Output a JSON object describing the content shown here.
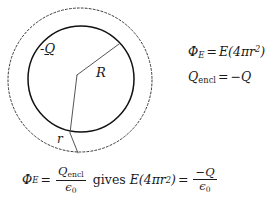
{
  "figure": {
    "type": "gauss-law-sphere-diagram",
    "colors": {
      "ink": "#1a1a1a",
      "solid_circle_stroke": "#111111",
      "dashed_circle_stroke": "#3a3a3a",
      "radius_line_stroke": "#555555",
      "background": "#ffffff"
    },
    "diagram": {
      "gaussian_surface": {
        "label": "dashed-gaussian-sphere",
        "cx": 80,
        "cy": 80,
        "r": 72,
        "dash": "2 2"
      },
      "charged_sphere": {
        "label": "solid-charged-sphere",
        "cx": 81,
        "cy": 79,
        "r": 53
      },
      "vertex": {
        "x": 77,
        "y": 75
      },
      "radius_R_line": {
        "x1": 77,
        "y1": 75,
        "x2": 119,
        "y2": 44
      },
      "radius_r_line": {
        "x1": 77,
        "y1": 75,
        "x2": 70,
        "y2": 133,
        "x3": 78,
        "y3": 153
      },
      "labels": {
        "charge": {
          "sign": "-",
          "symbol": "Q"
        },
        "outer_radius": "R",
        "inner_radius": "r"
      }
    },
    "equations": {
      "right": {
        "line1": {
          "lhs_symbol": "Φ",
          "lhs_sub": "E",
          "equals": "=",
          "rhs": "E(4πr",
          "rhs_exp": "2",
          "rhs_close": ")"
        },
        "line2": {
          "lhs_symbol": "Q",
          "lhs_sub": "encl",
          "equals": "=",
          "rhs_sign": "−",
          "rhs_symbol": "Q"
        }
      },
      "bottom": {
        "lhs_symbol": "Φ",
        "lhs_sub": "E",
        "equals_1": "=",
        "frac1_num_symbol": "Q",
        "frac1_num_sub": "encl",
        "frac1_den_symbol": "ϵ",
        "frac1_den_sub": "0",
        "connector": "gives",
        "mid": "E(4πr",
        "mid_exp": "2",
        "mid_close": ")",
        "equals_2": "=",
        "frac2_num_sign": "−",
        "frac2_num_symbol": "Q",
        "frac2_den_symbol": "ϵ",
        "frac2_den_sub": "0"
      }
    }
  }
}
